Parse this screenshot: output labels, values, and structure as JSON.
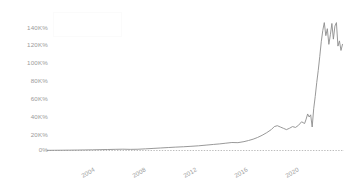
{
  "chart_data": {
    "type": "line",
    "title": "",
    "subtitle": "",
    "xlabel": "",
    "ylabel": "",
    "xlim": [
      2003.0,
      2022.6
    ],
    "ylim": [
      0,
      150000
    ],
    "yticks": [
      0,
      20000,
      40000,
      60000,
      80000,
      100000,
      120000,
      140000
    ],
    "ytick_labels": [
      "0%",
      "20K%",
      "40K%",
      "60K%",
      "80K%",
      "100K%",
      "120K%",
      "140K%"
    ],
    "xticks": [
      2004,
      2008,
      2012,
      2016,
      2020
    ],
    "xtick_labels": [
      "2004",
      "2008",
      "2012",
      "2016",
      "2020"
    ],
    "grid": false,
    "legend": {
      "present": true,
      "position": "top-left",
      "entries": []
    },
    "series": [
      {
        "name": "series-1",
        "color": "#8d8d8d",
        "x": [
          2003.0,
          2003.5,
          2004.0,
          2004.5,
          2005.0,
          2005.5,
          2006.0,
          2006.5,
          2007.0,
          2007.5,
          2008.0,
          2008.5,
          2009.0,
          2009.5,
          2010.0,
          2010.5,
          2011.0,
          2011.5,
          2012.0,
          2012.5,
          2013.0,
          2013.5,
          2014.0,
          2014.4,
          2014.8,
          2015.2,
          2015.6,
          2016.0,
          2016.3,
          2016.6,
          2016.9,
          2017.2,
          2017.5,
          2017.8,
          2018.0,
          2018.2,
          2018.4,
          2018.6,
          2018.8,
          2019.0,
          2019.2,
          2019.4,
          2019.6,
          2019.8,
          2020.0,
          2020.1,
          2020.2,
          2020.3,
          2020.4,
          2020.5,
          2020.6,
          2020.7,
          2020.8,
          2020.9,
          2021.0,
          2021.1,
          2021.2,
          2021.3,
          2021.4,
          2021.5,
          2021.6,
          2021.7,
          2021.8,
          2021.9,
          2022.0,
          2022.1,
          2022.2,
          2022.3,
          2022.4,
          2022.5
        ],
        "y": [
          200,
          260,
          330,
          420,
          520,
          640,
          780,
          950,
          1150,
          1350,
          1500,
          1300,
          1450,
          1900,
          2400,
          2900,
          3400,
          3900,
          4300,
          4800,
          5400,
          6200,
          7000,
          7600,
          8400,
          9200,
          9000,
          10200,
          11500,
          13000,
          15000,
          17500,
          20500,
          24000,
          27500,
          28500,
          27000,
          25500,
          24000,
          25500,
          27500,
          26500,
          29000,
          33000,
          31000,
          36000,
          42000,
          38500,
          41000,
          27000,
          48000,
          62000,
          78000,
          92000,
          108000,
          125000,
          138000,
          147000,
          132000,
          140000,
          122000,
          133000,
          146000,
          128000,
          143000,
          147000,
          120000,
          126000,
          115000,
          122000
        ]
      }
    ],
    "zero_baseline": {
      "value": 0,
      "style": "dotted",
      "color": "#bdbdbd"
    }
  },
  "axes": {
    "y_labels": [
      {
        "text": "140K%",
        "top": 25
      },
      {
        "text": "120K%",
        "top": 42
      },
      {
        "text": "100K%",
        "top": 60
      },
      {
        "text": "80K%",
        "top": 78
      },
      {
        "text": "60K%",
        "top": 96
      },
      {
        "text": "40K%",
        "top": 114
      },
      {
        "text": "20K%",
        "top": 132
      },
      {
        "text": "0%",
        "top": 147
      }
    ],
    "x_labels": [
      {
        "text": "2004",
        "left": 80,
        "top": 166
      },
      {
        "text": "2008",
        "left": 131,
        "top": 166
      },
      {
        "text": "2012",
        "left": 182,
        "top": 166
      },
      {
        "text": "2016",
        "left": 233,
        "top": 166
      },
      {
        "text": "2020",
        "left": 284,
        "top": 166
      }
    ]
  },
  "legend_box": {
    "label": ""
  }
}
